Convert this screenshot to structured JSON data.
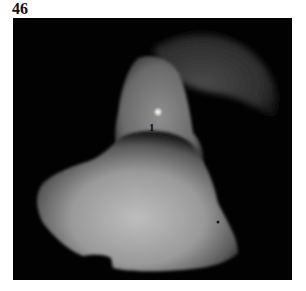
{
  "figure": {
    "number": "46",
    "markers": [
      {
        "label": "1",
        "x": 136,
        "y": 104
      }
    ],
    "colors": {
      "background": "#020202",
      "tissue_light": "#b8b8b8",
      "tissue_mid": "#7a7a7a",
      "tissue_dark": "#2a2a2a",
      "page": "#ffffff"
    }
  }
}
